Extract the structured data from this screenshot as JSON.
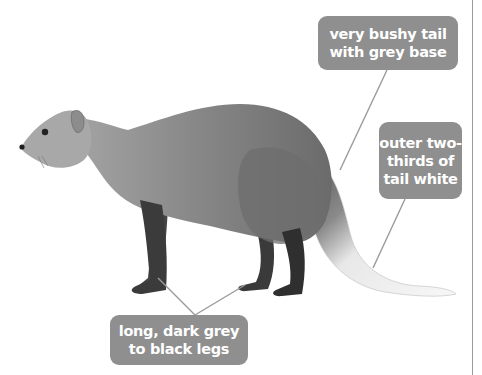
{
  "figure": {
    "colors": {
      "background": "#ffffff",
      "label_fill": "#8f8f8f",
      "label_text": "#ffffff",
      "leader_line": "#9a9a9a",
      "body_grey": "#7d7d7d",
      "head_grey": "#a9a9a9",
      "legs_dark": "#3f3f3f",
      "tail_white": "#f2f2f2"
    }
  },
  "callouts": [
    {
      "id": "tail-base",
      "lines": [
        "very bushy tail",
        "with grey base"
      ]
    },
    {
      "id": "tail-white",
      "lines": [
        "outer two-",
        "thirds of",
        "tail white"
      ]
    },
    {
      "id": "legs",
      "lines": [
        "long, dark grey",
        "to black legs"
      ]
    }
  ]
}
